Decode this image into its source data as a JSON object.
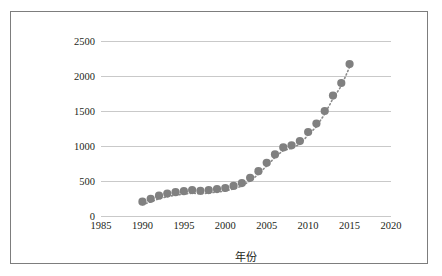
{
  "chart_data": {
    "type": "scatter",
    "title": "",
    "xlabel": "年份",
    "ylabel": "VOCs排放量（万t）",
    "xlim": [
      1985,
      2020
    ],
    "ylim": [
      0,
      2500
    ],
    "xticks": [
      1985,
      1990,
      1995,
      2000,
      2005,
      2010,
      2015,
      2020
    ],
    "yticks": [
      0,
      500,
      1000,
      1500,
      2000,
      2500
    ],
    "grid": "horizontal",
    "legend": "none",
    "marker_color": "#808080",
    "trendline_color": "#8a8a8a",
    "trendline_style": "dotted",
    "series": [
      {
        "name": "VOCs排放量",
        "x": [
          1990,
          1991,
          1992,
          1993,
          1994,
          1995,
          1996,
          1997,
          1998,
          1999,
          2000,
          2001,
          2002,
          2003,
          2004,
          2005,
          2006,
          2007,
          2008,
          2009,
          2010,
          2011,
          2012,
          2013,
          2014,
          2015
        ],
        "values": [
          205,
          245,
          290,
          320,
          340,
          355,
          370,
          360,
          370,
          385,
          400,
          430,
          470,
          545,
          640,
          760,
          880,
          980,
          1010,
          1070,
          1200,
          1320,
          1500,
          1720,
          1900,
          2170
        ]
      }
    ]
  },
  "axes": {
    "y_title": "VOCs排放量（万t）",
    "x_title": "年份",
    "y_tick_labels": [
      "2500",
      "2000",
      "1500",
      "1000",
      "500",
      "0"
    ],
    "x_tick_labels": [
      "1985",
      "1990",
      "1995",
      "2000",
      "2005",
      "2010",
      "2015",
      "2020"
    ]
  },
  "colors": {
    "marker": "#808080",
    "gridline": "#c9c9c9",
    "frame": "#7d7d7d",
    "text": "#231f20",
    "background": "#ffffff"
  }
}
